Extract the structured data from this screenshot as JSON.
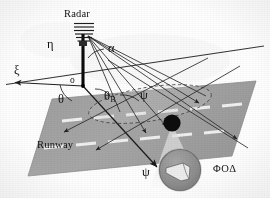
{
  "figure": {
    "type": "technical-diagram",
    "background_color": "#fefefe"
  },
  "labels": {
    "radar": "Radar",
    "origin": "o",
    "axis_xi": "ξ",
    "axis_eta": "η",
    "angle_alpha": "α",
    "angle_theta": "θ",
    "angle_theta_b": "θ",
    "angle_theta_b_sub": "B",
    "angle_psi_upper": "ψ",
    "angle_psi_lower": "ψ",
    "runway": "Runway",
    "fod": "ΦΟΔ"
  },
  "colors": {
    "ink": "#111111",
    "line": "#2b2b2b",
    "runway_fill": "#a3a3a3",
    "runway_edge": "#8d8d8d",
    "centerline": "#f2f2f2",
    "fod_object": "#0d0d0d",
    "beam_cone": "#e9e9e9",
    "inset_fill": "#8f8f8f",
    "inset_ring": "#5a5a5a",
    "footprint": "#bdbdbd",
    "horizon": "#3a3a3a"
  },
  "geometry": {
    "radar_mast": {
      "base_x": 83,
      "base_y": 86,
      "top_x": 83,
      "top_y": 32,
      "array_bars": 6,
      "description": "vertical radar mast with stacked antenna array elements at top"
    },
    "origin_point": {
      "x": 83,
      "y": 86
    },
    "axis_xi": {
      "from_x": 83,
      "from_y": 86,
      "to_x": 14,
      "to_y": 82,
      "arrow": "left",
      "label_x": 17,
      "label_y": 66
    },
    "axis_eta": {
      "from_x": 83,
      "from_y": 86,
      "to_x": 83,
      "to_y": 32,
      "arrow": "up",
      "label_x": 52,
      "label_y": 37
    },
    "horizon": {
      "x1": 6,
      "y1": 84,
      "x2": 264,
      "y2": 46
    },
    "runway": {
      "points": "52,99 256,81 232,156 28,176",
      "centerlines": 2,
      "dash_count": 6
    },
    "beams": [
      {
        "x1": 88,
        "y1": 36,
        "x2": 168,
        "y2": 128,
        "arrow": true
      },
      {
        "x1": 88,
        "y1": 36,
        "x2": 148,
        "y2": 134,
        "arrow": true
      },
      {
        "x1": 88,
        "y1": 36,
        "x2": 200,
        "y2": 104,
        "arrow": true
      },
      {
        "x1": 88,
        "y1": 36,
        "x2": 238,
        "y2": 140,
        "arrow": true
      },
      {
        "x1": 88,
        "y1": 36,
        "x2": 160,
        "y2": 172,
        "arrow": true
      },
      {
        "x1": 83,
        "y1": 86,
        "x2": 158,
        "y2": 168,
        "arrow": true
      }
    ],
    "footprint_ellipse": {
      "cx": 150,
      "cy": 104,
      "rx": 62,
      "ry": 17,
      "rotation": -9,
      "dashed": true
    },
    "fod_object": {
      "cx": 172,
      "cy": 123,
      "r": 8.5
    },
    "magnifier_cone": {
      "apex_x": 172,
      "apex_y": 124,
      "left_x": 152,
      "left_y": 186,
      "right_x": 200,
      "right_y": 186
    },
    "inset_circle": {
      "cx": 180,
      "cy": 170,
      "r": 20
    },
    "fod_label_pos": {
      "x": 214,
      "y": 164
    },
    "runway_label_pos": {
      "x": 38,
      "y": 142
    }
  }
}
